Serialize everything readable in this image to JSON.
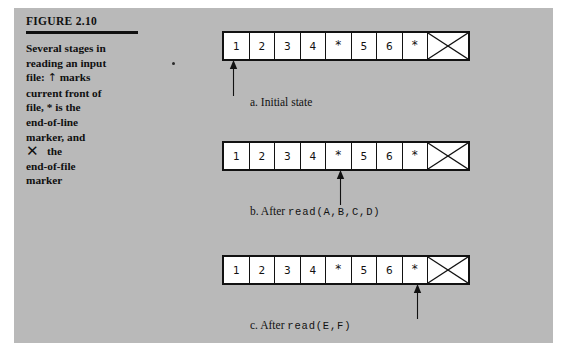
{
  "figure": {
    "label": "FIGURE 2.10",
    "caption_lines": [
      "Several stages in",
      "reading an input",
      "file: ↑ marks",
      "current front of",
      "file, * is the",
      "end-of-line",
      "marker, and",
      "✕ the",
      "end-of-file",
      "marker"
    ],
    "caption_plain": "Several stages in reading an input file: ↑ marks current front of file, * is the end-of-line marker, and ✕ the end-of-file marker",
    "symbols": {
      "front_marker": "↑",
      "end_of_line_marker": "*",
      "end_of_file_marker": "✕"
    }
  },
  "colors": {
    "panel_background": "#b9b9b9",
    "page_background": "#ffffff",
    "ink": "#111111",
    "cell_fill": "#ffffff"
  },
  "tape_cells": [
    "1",
    "2",
    "3",
    "4",
    "*",
    "5",
    "6",
    "*"
  ],
  "stages": [
    {
      "id": "a",
      "caption_prefix": "a. Initial state",
      "caption_mono": "",
      "cells": [
        "1",
        "2",
        "3",
        "4",
        "*",
        "5",
        "6",
        "*"
      ],
      "eof_cell": "✕",
      "pointer_cell_index": 0,
      "pointer_target_value": "1"
    },
    {
      "id": "b",
      "caption_prefix": "b. After ",
      "caption_mono": "read(A,B,C,D)",
      "cells": [
        "1",
        "2",
        "3",
        "4",
        "*",
        "5",
        "6",
        "*"
      ],
      "eof_cell": "✕",
      "pointer_cell_index": 4,
      "pointer_target_value": "*"
    },
    {
      "id": "c",
      "caption_prefix": "c. After ",
      "caption_mono": "read(E,F)",
      "cells": [
        "1",
        "2",
        "3",
        "4",
        "*",
        "5",
        "6",
        "*"
      ],
      "eof_cell": "✕",
      "pointer_cell_index": 7,
      "pointer_target_value": "*"
    }
  ]
}
